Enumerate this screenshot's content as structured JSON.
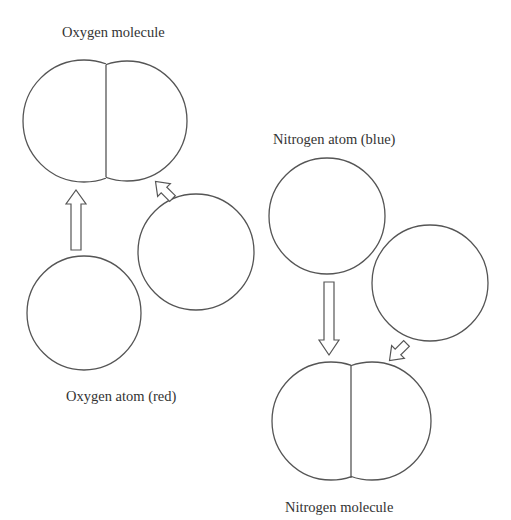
{
  "labels": {
    "oxygen_molecule": "Oxygen molecule",
    "oxygen_atom": "Oxygen atom (red)",
    "nitrogen_atom": "Nitrogen atom (blue)",
    "nitrogen_molecule": "Nitrogen molecule"
  },
  "colors": {
    "stroke": "#555555",
    "text": "#333333",
    "background": "#ffffff"
  },
  "diagram": {
    "oxygen_molecule": {
      "left_lobe": {
        "cx": 84,
        "cy": 121,
        "r": 61
      },
      "right_lobe": {
        "cx": 128,
        "cy": 121,
        "r": 59
      }
    },
    "oxygen_atoms": [
      {
        "cx": 84,
        "cy": 313,
        "r": 57
      },
      {
        "cx": 196,
        "cy": 252,
        "r": 58
      }
    ],
    "nitrogen_atoms": [
      {
        "cx": 327,
        "cy": 216,
        "r": 58
      },
      {
        "cx": 430,
        "cy": 283,
        "r": 58
      }
    ],
    "nitrogen_molecule": {
      "left_lobe": {
        "cx": 331,
        "cy": 420,
        "r": 60
      },
      "right_lobe": {
        "cx": 372,
        "cy": 420,
        "r": 59
      }
    }
  }
}
